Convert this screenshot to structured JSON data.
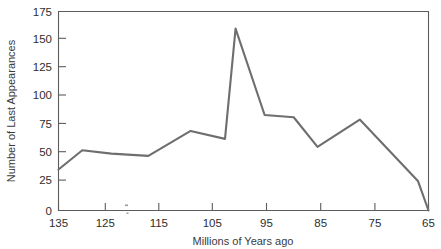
{
  "chart_data": {
    "type": "line",
    "title": "",
    "xlabel": "Millions of Years ago",
    "ylabel": "Number of Last Appearances",
    "xlim": [
      135,
      65
    ],
    "ylim": [
      0,
      175
    ],
    "x_ticks": [
      135,
      125,
      115,
      105,
      95,
      85,
      75,
      65
    ],
    "y_ticks": [
      0,
      25,
      50,
      75,
      100,
      125,
      150,
      175
    ],
    "x_axis_inverted": true,
    "grid": false,
    "legend": "none",
    "series": [
      {
        "name": "Last Appearances",
        "x": [
          135,
          130.5,
          125,
          118,
          110,
          103.5,
          101.5,
          96,
          90.5,
          86,
          78,
          67,
          65
        ],
        "values": [
          36,
          53,
          50,
          48,
          70,
          63,
          160,
          84,
          82,
          56,
          80,
          26,
          0
        ]
      }
    ]
  },
  "axis_titles": {
    "x": "Millions of Years ago",
    "y": "Number of Last Appearances"
  },
  "y_tick_labels": [
    "175",
    "150",
    "125",
    "100",
    "75",
    "50",
    "25",
    "0"
  ],
  "x_tick_labels": [
    "135",
    "125",
    "115",
    "105",
    "95",
    "85",
    "75",
    "65"
  ],
  "colors": {
    "line": "#6e6e6e",
    "axis": "#5c5c5c",
    "text": "#2e2e2e",
    "background": "#ffffff"
  }
}
